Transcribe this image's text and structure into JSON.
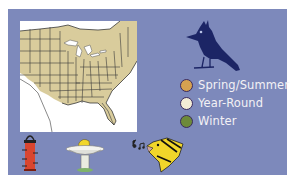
{
  "range_map": {
    "description": "Range map of eastern North America",
    "colors": {
      "panel_background": "#7d89bb",
      "range_fill": "#d9cc9c",
      "map_background": "#ffffff",
      "border_lines": "#3a3a3a"
    }
  },
  "species_icon": {
    "name": "jay-silhouette",
    "color": "#1c2565"
  },
  "legend": {
    "items": [
      {
        "label": "Spring/Summer",
        "color": "#d6a250"
      },
      {
        "label": "Year-Round",
        "color": "#f2ecd6"
      },
      {
        "label": "Winter",
        "color": "#6d8a3a"
      }
    ]
  },
  "attraction_icons": [
    {
      "name": "feeder-icon",
      "color": "#d9452f"
    },
    {
      "name": "birdbath-icon",
      "color": "#f3f3ee"
    },
    {
      "name": "singing-bird-icon",
      "color": "#f1d62a"
    }
  ]
}
